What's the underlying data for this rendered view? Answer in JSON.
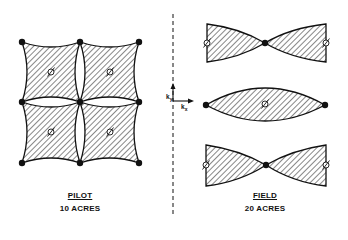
{
  "pilot": {
    "title": "PILOT",
    "subtitle": "10 ACRES",
    "injector_wells": [
      [
        22,
        42
      ],
      [
        80,
        42
      ],
      [
        139,
        42
      ],
      [
        22,
        102
      ],
      [
        80,
        102
      ],
      [
        139,
        102
      ],
      [
        22,
        163
      ],
      [
        80,
        163
      ],
      [
        139,
        163
      ]
    ],
    "producer_wells": [
      [
        51,
        72
      ],
      [
        110,
        72
      ],
      [
        51,
        132
      ],
      [
        110,
        132
      ]
    ]
  },
  "field": {
    "title": "FIELD",
    "subtitle": "20 ACRES",
    "bowtie_top": {
      "x0": 207,
      "x1": 326,
      "y0": 24,
      "y1": 62,
      "center": [
        265,
        43
      ]
    },
    "lens": {
      "x0": 206,
      "x1": 325,
      "y": 105,
      "top": 87,
      "bottom": 121
    },
    "bowtie_bottom": {
      "x0": 206,
      "x1": 326,
      "y0": 145,
      "y1": 186,
      "center": [
        266,
        165
      ]
    }
  },
  "axes": {
    "x_label": "k",
    "x_sub": "x",
    "y_label": "k",
    "y_sub": "y"
  },
  "colors": {
    "ink": "#111111",
    "background": "#ffffff"
  }
}
